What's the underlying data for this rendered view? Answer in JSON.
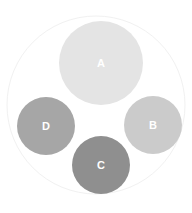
{
  "diagram": {
    "type": "circle-packing",
    "background": "#ffffff",
    "container": {
      "cx": 96,
      "cy": 105,
      "r": 89,
      "fill": "#ffffff",
      "stroke": "#f1f1f1"
    },
    "nodes": [
      {
        "label": "A",
        "cx": 101,
        "cy": 63,
        "r": 42,
        "color": "#e4e4e4"
      },
      {
        "label": "B",
        "cx": 153,
        "cy": 125,
        "r": 29,
        "color": "#cbcbcb"
      },
      {
        "label": "C",
        "cx": 101,
        "cy": 165,
        "r": 29,
        "color": "#8f8f8f"
      },
      {
        "label": "D",
        "cx": 46,
        "cy": 126,
        "r": 29,
        "color": "#a6a6a6"
      }
    ]
  }
}
